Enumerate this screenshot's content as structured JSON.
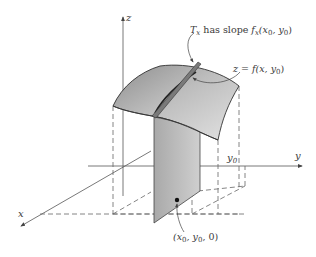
{
  "diagram": {
    "type": "3d-surface-partial-derivative",
    "axes": {
      "x_label": "x",
      "y_label": "y",
      "z_label": "z"
    },
    "marks": {
      "y0_label_main": "y",
      "y0_label_sub": "0"
    },
    "annotations": {
      "tangent_label": {
        "T": "T",
        "T_sub": "x",
        "text": " has slope ",
        "f": "f",
        "f_sub": "x",
        "args_open": "(x",
        "args_sub1": "0",
        "args_mid": ", y",
        "args_sub2": "0",
        "args_close": ")"
      },
      "curve_label": {
        "lhs": "z",
        "eq": " = ",
        "rhs_open": "f(x, y",
        "rhs_sub": "0",
        "rhs_close": ")"
      },
      "point_label": {
        "open": "(x",
        "sub1": "0",
        "mid": ", y",
        "sub2": "0",
        "close": ", 0)"
      }
    },
    "colors": {
      "ink": "#3a3a3a",
      "axis": "#555555",
      "surface_light": "#d4d4d4",
      "surface_dark": "#8c8c8c",
      "plane": "#b8b8b8",
      "plane_dark": "#9a9a9a",
      "dashed": "#666666"
    }
  }
}
